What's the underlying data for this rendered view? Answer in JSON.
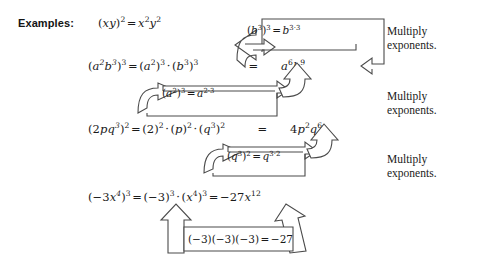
{
  "page": {
    "label": "Examples:",
    "background_color": "#ffffff",
    "ink_color": "#1a1a1a",
    "outline_color": "#4a4a4a"
  },
  "equations": [
    {
      "id": "eq-xy-squared",
      "parts": [
        "(xy)2",
        "=",
        "x2y2"
      ],
      "plain": "(xy)^2 = x^2 y^2"
    },
    {
      "id": "eq-a2b3-cubed",
      "parts": [
        "(a2b3)3",
        "=",
        "(a2)3 · (b3)3",
        "=",
        "a6b9"
      ],
      "plain": "(a^2 b^3)^3 = (a^2)^3 · (b^3)^3 = a^6 b^9"
    },
    {
      "id": "eq-2pq3-squared",
      "parts": [
        "(2pq3)2",
        "=",
        "(2)2 · (p)2 · (q3)2",
        "=",
        "4p2q6"
      ],
      "plain": "(2pq^3)^2 = (2)^2 · (p)^2 · (q^3)^2 = 4p^2 q^6"
    },
    {
      "id": "eq-neg3x4-cubed",
      "parts": [
        "(−3x4)3",
        "=",
        "(−3)3 · (x4)3",
        "=",
        "−27x12"
      ],
      "plain": "(−3x^4)^3 = (−3)^3 · (x^4)^3 = −27x^12"
    }
  ],
  "callouts": [
    {
      "id": "callout-b3",
      "plain": "(b^3)^3 = b^{3·3}"
    },
    {
      "id": "callout-a2",
      "plain": "(a^2)^3 = a^{2·3}"
    },
    {
      "id": "callout-q3",
      "plain": "(q^3)^2 = q^{3·2}"
    },
    {
      "id": "callout-neg3",
      "plain": "(−3)(−3)(−3) = −27"
    }
  ],
  "notes": [
    {
      "id": "note-1",
      "line1": "Multiply",
      "line2": "exponents."
    },
    {
      "id": "note-2",
      "line1": "Multiply",
      "line2": "exponents."
    },
    {
      "id": "note-3",
      "line1": "Multiply",
      "line2": "exponents."
    }
  ]
}
